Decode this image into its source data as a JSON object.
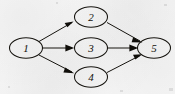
{
  "figure": {
    "type": "directed-graph",
    "background_color": "#f6f6f6",
    "ink_color": "#16140f",
    "width": 175,
    "height": 94,
    "nodes": [
      {
        "id": "1",
        "label": "1",
        "cx": 26,
        "cy": 48,
        "rx": 16,
        "ry": 10
      },
      {
        "id": "2",
        "label": "2",
        "cx": 91,
        "cy": 17,
        "rx": 16,
        "ry": 10
      },
      {
        "id": "3",
        "label": "3",
        "cx": 91,
        "cy": 48,
        "rx": 16,
        "ry": 10
      },
      {
        "id": "4",
        "label": "4",
        "cx": 91,
        "cy": 77,
        "rx": 16,
        "ry": 10
      },
      {
        "id": "5",
        "label": "5",
        "cx": 154,
        "cy": 48,
        "rx": 16,
        "ry": 10
      }
    ],
    "edges": [
      {
        "from": "1",
        "to": "2",
        "directed": true,
        "x1": 39,
        "y1": 41,
        "x2": 74,
        "y2": 21
      },
      {
        "from": "1",
        "to": "3",
        "directed": true,
        "x1": 42,
        "y1": 48,
        "x2": 74,
        "y2": 48
      },
      {
        "from": "1",
        "to": "4",
        "directed": true,
        "x1": 39,
        "y1": 55,
        "x2": 74,
        "y2": 73
      },
      {
        "from": "2",
        "to": "5",
        "directed": true,
        "x1": 108,
        "y1": 21,
        "x2": 142,
        "y2": 41
      },
      {
        "from": "3",
        "to": "5",
        "directed": true,
        "x1": 108,
        "y1": 48,
        "x2": 138,
        "y2": 48
      },
      {
        "from": "4",
        "to": "5",
        "directed": true,
        "x1": 108,
        "y1": 73,
        "x2": 142,
        "y2": 55
      }
    ]
  }
}
